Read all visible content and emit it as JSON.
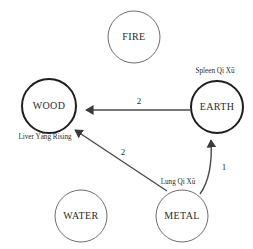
{
  "diagram": {
    "width": 253,
    "height": 249,
    "colors": {
      "background": "#ffffff",
      "node_stroke_strong": "#1e1e1e",
      "node_stroke_weak": "#6e6e6e",
      "edge": "#4a4a4a",
      "text": "#2b2b2b"
    },
    "nodes": [
      {
        "id": "fire",
        "label": "FIRE",
        "cx": 134,
        "cy": 37,
        "r": 26,
        "emphasis": "weak"
      },
      {
        "id": "wood",
        "label": "WOOD",
        "cx": 49,
        "cy": 106,
        "r": 27,
        "emphasis": "strong"
      },
      {
        "id": "earth",
        "label": "EARTH",
        "cx": 217,
        "cy": 107,
        "r": 26,
        "emphasis": "strong"
      },
      {
        "id": "water",
        "label": "WATER",
        "cx": 81,
        "cy": 216,
        "r": 26,
        "emphasis": "weak"
      },
      {
        "id": "metal",
        "label": "METAL",
        "cx": 182,
        "cy": 216,
        "r": 26,
        "emphasis": "weak"
      }
    ],
    "edges": [
      {
        "id": "earth-to-wood",
        "from": "earth",
        "to": "wood",
        "weight": "2",
        "weight_x": 139,
        "weight_y": 104,
        "path": "M 190 110 L 86 110",
        "arrow": "arrowhead-large"
      },
      {
        "id": "metal-to-wood",
        "from": "metal",
        "to": "wood",
        "weight": "2",
        "weight_x": 123,
        "weight_y": 155,
        "path": "M 167 191 L 75 130",
        "arrow": "arrowhead-large"
      },
      {
        "id": "metal-to-earth",
        "from": "metal",
        "to": "earth",
        "weight": "1",
        "weight_x": 224,
        "weight_y": 170,
        "path": "M 200 194 Q 213 176 211 140",
        "arrow": "arrowhead-large"
      }
    ],
    "annotations": [
      {
        "id": "spleen-qi-xu",
        "text": "Spleen Qi Xū",
        "x": 215,
        "y": 73,
        "anchor": "middle"
      },
      {
        "id": "liver-yang-rising",
        "text": "Liver Yáng Rising",
        "x": 45,
        "y": 139,
        "anchor": "middle"
      },
      {
        "id": "lung-qi-xu",
        "text": "Lung Qi Xū",
        "x": 178,
        "y": 184,
        "anchor": "middle"
      }
    ]
  }
}
